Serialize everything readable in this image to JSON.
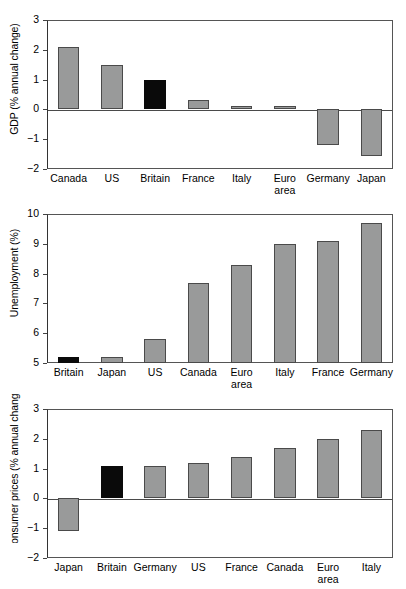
{
  "figure": {
    "clipped_header": "",
    "bar_color": "#999a9a",
    "highlight_color": "#0a0a0a",
    "highlight_country": "Britain"
  },
  "chart_data": [
    {
      "type": "bar",
      "id": "gdp",
      "title": "",
      "xlabel": "",
      "ylabel": "GDP (% annual change)",
      "ylim": [
        -2,
        3
      ],
      "yticks": [
        3,
        2,
        1,
        0,
        -1,
        -2
      ],
      "ytick_labels": [
        "3",
        "2",
        "1",
        "0",
        "−1",
        "−2"
      ],
      "grid": false,
      "legend": "none",
      "categories": [
        "Canada",
        "US",
        "Britain",
        "France",
        "Italy",
        "Euro\narea",
        "Germany",
        "Japan"
      ],
      "values": [
        2.1,
        1.5,
        1.0,
        0.3,
        0.1,
        0.1,
        -1.2,
        -1.55
      ],
      "highlight_index": 2
    },
    {
      "type": "bar",
      "id": "unemployment",
      "title": "",
      "xlabel": "",
      "ylabel": "Unemployment (%)",
      "ylim": [
        5,
        10
      ],
      "yticks": [
        10,
        9,
        8,
        7,
        6,
        5
      ],
      "ytick_labels": [
        "10",
        "9",
        "8",
        "7",
        "6",
        "5"
      ],
      "grid": false,
      "legend": "none",
      "categories": [
        "Britain",
        "Japan",
        "US",
        "Canada",
        "Euro\narea",
        "Italy",
        "France",
        "Germany"
      ],
      "values": [
        5.2,
        5.2,
        5.8,
        7.7,
        8.3,
        9.0,
        9.1,
        9.7
      ],
      "highlight_index": 0
    },
    {
      "type": "bar",
      "id": "consumer_prices",
      "title": "",
      "xlabel": "",
      "ylabel": "Consumer prices (% annual change)",
      "ylim": [
        -2,
        3
      ],
      "yticks": [
        3,
        2,
        1,
        0,
        -1,
        -2
      ],
      "ytick_labels": [
        "3",
        "2",
        "1",
        "0",
        "−1",
        "−2"
      ],
      "grid": false,
      "legend": "none",
      "categories": [
        "Japan",
        "Britain",
        "Germany",
        "US",
        "France",
        "Canada",
        "Euro\narea",
        "Italy"
      ],
      "values": [
        -1.1,
        1.1,
        1.1,
        1.2,
        1.4,
        1.7,
        2.0,
        2.3
      ],
      "highlight_index": 1
    }
  ]
}
